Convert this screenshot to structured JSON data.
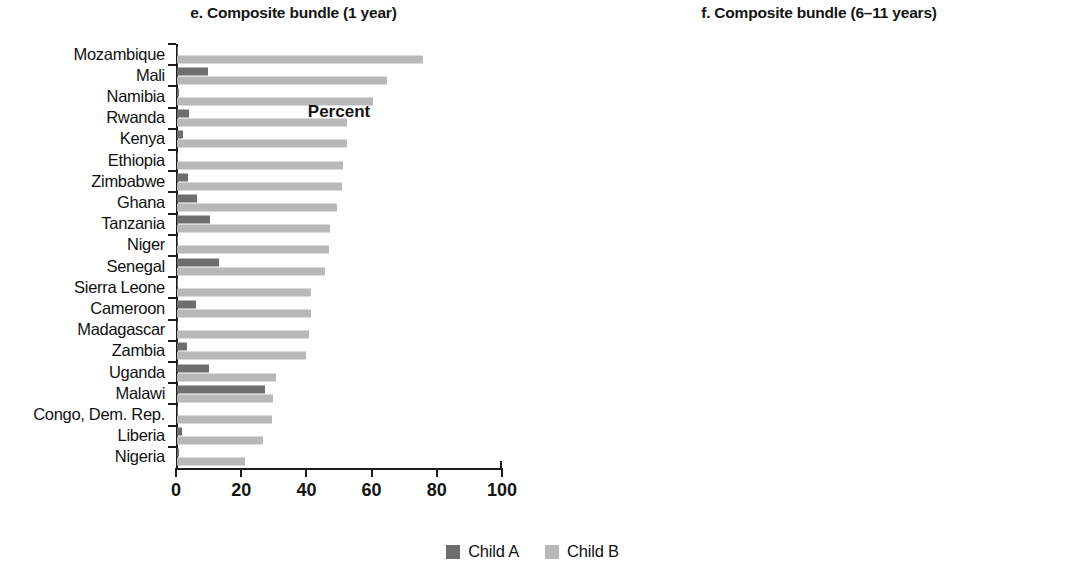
{
  "legend": {
    "position": "bottom-center",
    "entries": [
      {
        "label": "Child A",
        "color": "#6e6e6e"
      },
      {
        "label": "Child B",
        "color": "#b8b8b8"
      }
    ]
  },
  "chart_data": [
    {
      "type": "bar",
      "orientation": "horizontal",
      "title": "e. Composite bundle (1 year)",
      "xlabel": "Percent",
      "ylabel": "",
      "xlim": [
        0,
        100
      ],
      "xticks": [
        0,
        20,
        40,
        60,
        80,
        100
      ],
      "xtick_labels": [
        "0",
        "20",
        "40",
        "60",
        "80",
        "100"
      ],
      "grid": false,
      "legend_position": "bottom-center",
      "categories": [
        "Mozambique",
        "Mali",
        "Namibia",
        "Rwanda",
        "Kenya",
        "Ethiopia",
        "Zimbabwe",
        "Ghana",
        "Tanzania",
        "Niger",
        "Senegal",
        "Sierra Leone",
        "Cameroon",
        "Madagascar",
        "Zambia",
        "Uganda",
        "Malawi",
        "Congo, Dem. Rep.",
        "Liberia",
        "Nigeria"
      ],
      "series": [
        {
          "name": "Child A",
          "color": "#6e6e6e",
          "values": [
            0.3,
            9.5,
            0.7,
            3.8,
            1.8,
            0.4,
            3.5,
            6.0,
            10.0,
            0.4,
            12.8,
            0.3,
            5.8,
            0.3,
            3.2,
            9.8,
            27.0,
            0.3,
            1.5,
            0.6
          ]
        },
        {
          "name": "Child B",
          "color": "#b8b8b8",
          "values": [
            75.5,
            64.5,
            60.0,
            52.0,
            52.0,
            51.0,
            50.5,
            49.0,
            47.0,
            46.5,
            45.5,
            41.0,
            41.0,
            40.5,
            39.5,
            30.5,
            29.5,
            29.0,
            26.5,
            21.0
          ]
        }
      ]
    },
    {
      "type": "bar",
      "orientation": "horizontal",
      "title": "f. Composite bundle (6–11 years)",
      "xlabel": "Percent",
      "ylabel": "",
      "xlim": [
        0,
        100
      ],
      "xticks": [
        0,
        20,
        40,
        60,
        80,
        100
      ],
      "xtick_labels": [
        "0",
        "20",
        "40",
        "60",
        "80",
        "100"
      ],
      "grid": false,
      "legend_position": "bottom-center",
      "categories": [
        "Zimbabwe",
        "Malawi",
        "Namibia",
        "Uganda",
        "Kenya",
        "Zambia",
        "Mozambique",
        "Niger",
        "Mali",
        "Senegal",
        "Cameroon",
        "Tanzania",
        "Madagascar",
        "Congo, Dem. Rep.",
        "Sierra Leone",
        "Nigeria",
        "Rwanda",
        "Ghana",
        "Ethiopia",
        "Liberia"
      ],
      "series": [
        {
          "name": "Child A",
          "color": "#6e6e6e",
          "values": [
            16.5,
            54.0,
            1.0,
            38.0,
            9.0,
            13.0,
            0.4,
            0.4,
            19.5,
            22.0,
            22.0,
            26.0,
            0.4,
            1.0,
            7.0,
            8.0,
            11.0,
            16.5,
            2.0,
            1.0
          ]
        },
        {
          "name": "Child B",
          "color": "#b8b8b8",
          "values": [
            93.5,
            93.5,
            93.0,
            92.5,
            91.5,
            91.0,
            89.0,
            88.5,
            88.0,
            88.0,
            87.5,
            87.0,
            86.0,
            84.5,
            84.0,
            80.5,
            76.5,
            71.5,
            65.5,
            42.0
          ]
        }
      ]
    }
  ]
}
